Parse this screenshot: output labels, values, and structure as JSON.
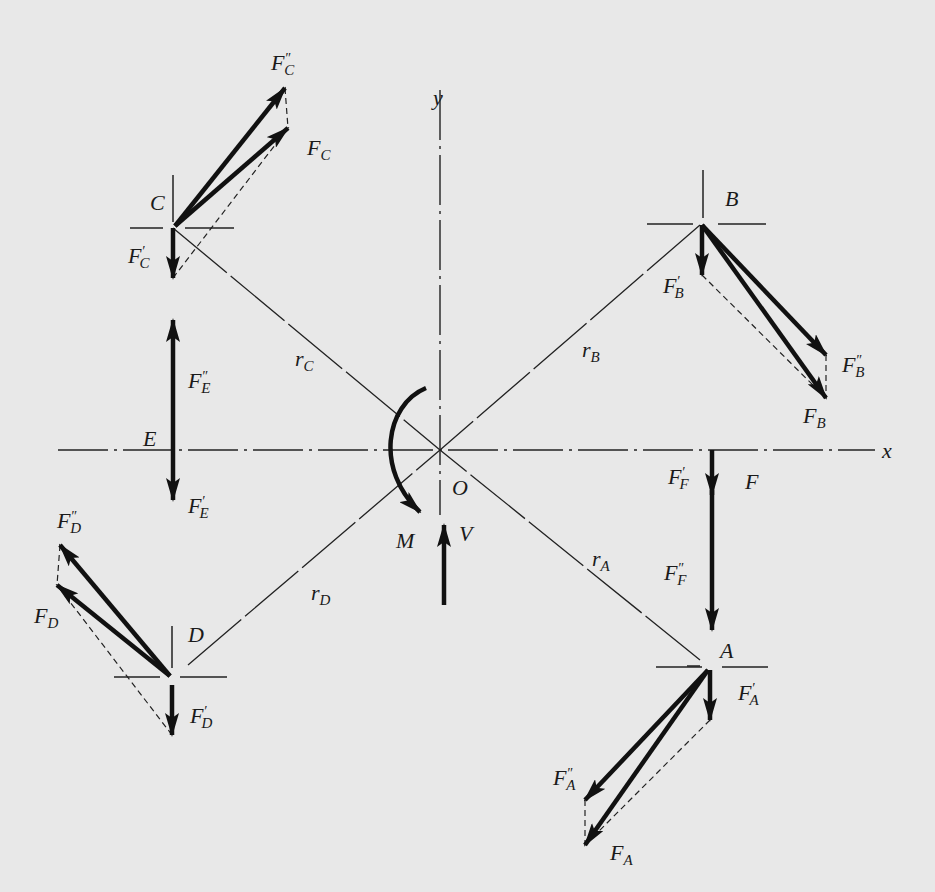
{
  "diagram": {
    "axes": {
      "x": "x",
      "y": "y",
      "origin": "O"
    },
    "loads": {
      "moment": "M",
      "shear": "V"
    },
    "bolts": [
      {
        "name": "A",
        "radius": "r",
        "radius_sub": "A",
        "resultant": "F",
        "resultant_sub": "A"
      },
      {
        "name": "B",
        "radius": "r",
        "radius_sub": "B",
        "resultant": "F",
        "resultant_sub": "B"
      },
      {
        "name": "C",
        "radius": "r",
        "radius_sub": "C",
        "resultant": "F",
        "resultant_sub": "C"
      },
      {
        "name": "D",
        "radius": "r",
        "radius_sub": "D",
        "resultant": "F",
        "resultant_sub": "D"
      },
      {
        "name": "E"
      },
      {
        "name": "F",
        "resultant": "F"
      }
    ],
    "labels": {
      "y_axis": "y",
      "x_axis": "x",
      "origin": "O",
      "moment": "M",
      "shear": "V",
      "A": "A",
      "B": "B",
      "C": "C",
      "D": "D",
      "E": "E",
      "F": "F",
      "F_base": "F",
      "r_base": "r",
      "sub_A": "A",
      "sub_B": "B",
      "sub_C": "C",
      "sub_D": "D",
      "sub_E": "E",
      "sub_F": "F",
      "prime": "′",
      "dprime": "″"
    }
  }
}
